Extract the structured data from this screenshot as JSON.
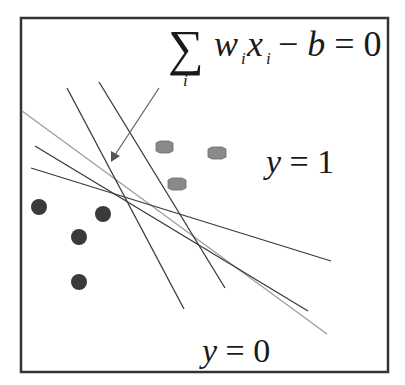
{
  "diagram": {
    "equation": {
      "sigma": "∑",
      "sigma_sub": "i",
      "w": "w",
      "w_sub": "i",
      "x": "x",
      "x_sub": "i",
      "rest": "− b = 0"
    },
    "class_labels": {
      "positive": "y = 1",
      "negative": "y = 0"
    },
    "positive_points_count": 3,
    "negative_points_count": 4,
    "separator_lines_count": 5,
    "colors": {
      "frame": "#333333",
      "positive_point": "#8a8a8a",
      "negative_point": "#3a3a3a",
      "line_dark": "#3a3a3a",
      "line_light": "#a0a0a0",
      "arrow": "#666666"
    }
  }
}
